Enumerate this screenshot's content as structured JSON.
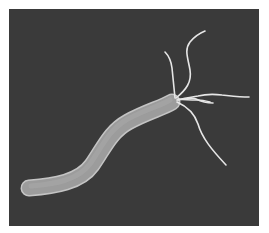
{
  "image": {
    "subject": "bacterium-illustration",
    "description": "Grayscale illustration of a curved rod-shaped bacterium with a tuft of flagella",
    "colors": {
      "page_background": "#ffffff",
      "panel_background": "#3a3a3a",
      "body_fill": "#9a9a9a",
      "body_edge": "#c8c8c8",
      "flagella": "#e6e6e6"
    }
  }
}
